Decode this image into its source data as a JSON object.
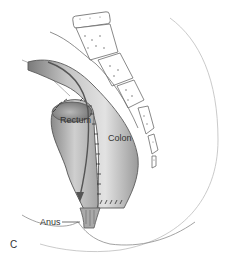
{
  "figure": {
    "panel_letter": "C",
    "labels": {
      "rectum": "Rectum",
      "colon": "Colon",
      "anus": "Anus"
    },
    "colors": {
      "background": "#ffffff",
      "outline": "#555555",
      "shading_dark": "#8a8a8a",
      "shading_light": "#d6d6d6",
      "label_text": "#333333",
      "arrow": "#555555"
    }
  }
}
